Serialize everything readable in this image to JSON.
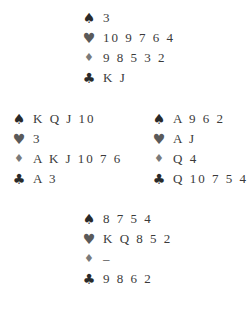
{
  "suits": {
    "spade": "♠",
    "heart": "♥",
    "diamond": "♦",
    "club": "♣"
  },
  "hands": {
    "north": {
      "spades": "3",
      "hearts": "10 9 7 6 4",
      "diamonds": "9 8 5 3 2",
      "clubs": "K J"
    },
    "west": {
      "spades": "K Q J 10",
      "hearts": "3",
      "diamonds": "A K J 10 7 6",
      "clubs": "A 3"
    },
    "east": {
      "spades": "A 9 6 2",
      "hearts": "A J",
      "diamonds": "Q 4",
      "clubs": "Q 10 7 5 4"
    },
    "south": {
      "spades": "8 7 5 4",
      "hearts": "K Q 8 5 2",
      "diamonds": "–",
      "clubs": "9 8 6 2"
    }
  }
}
